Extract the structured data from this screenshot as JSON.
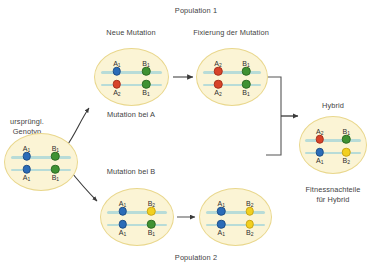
{
  "diagram": {
    "title_top": "Population 1",
    "title_bottom": "Population 2",
    "colors": {
      "cell_fill": "#fbf4d5",
      "cell_stroke": "#e9d78d",
      "chromosome": "#b8dcd8",
      "allele_A1": "#2b6cb8",
      "allele_A2": "#d8432a",
      "allele_B1": "#3f9233",
      "allele_B2": "#f2d020",
      "arrow": "#3a3a3a",
      "connector": "#555555"
    },
    "labels": {
      "original_genotype": "ursprüngl.\nGenotyp",
      "original_genotype_line1": "ursprüngl.",
      "original_genotype_line2": "Genotyp",
      "new_mutation": "Neue Mutation",
      "fixation": "Fixierung der Mutation",
      "mutation_at_a": "Mutation bei A",
      "mutation_at_b": "Mutation bei B",
      "hybrid": "Hybrid",
      "fitness_line1": "Fitnessnachteile",
      "fitness_line2": "für Hybrid"
    },
    "cells": [
      {
        "id": "original-genotype",
        "name": "cell-original-genotype",
        "top_chromosome": {
          "left": {
            "allele": "A1",
            "label": "A",
            "sub": "1",
            "color": "allele_A1"
          },
          "right": {
            "allele": "B1",
            "label": "B",
            "sub": "1",
            "color": "allele_B1"
          }
        },
        "bottom_chromosome": {
          "left": {
            "allele": "A1",
            "label": "A",
            "sub": "1",
            "color": "allele_A1"
          },
          "right": {
            "allele": "B1",
            "label": "B",
            "sub": "1",
            "color": "allele_B1"
          }
        }
      },
      {
        "id": "new-mutation",
        "name": "cell-new-mutation",
        "top_chromosome": {
          "left": {
            "allele": "A1",
            "label": "A",
            "sub": "1",
            "color": "allele_A1"
          },
          "right": {
            "allele": "B1",
            "label": "B",
            "sub": "1",
            "color": "allele_B1"
          }
        },
        "bottom_chromosome": {
          "left": {
            "allele": "A2",
            "label": "A",
            "sub": "2",
            "color": "allele_A2"
          },
          "right": {
            "allele": "B1",
            "label": "B",
            "sub": "1",
            "color": "allele_B1"
          }
        }
      },
      {
        "id": "fixation",
        "name": "cell-fixation",
        "top_chromosome": {
          "left": {
            "allele": "A2",
            "label": "A",
            "sub": "2",
            "color": "allele_A2"
          },
          "right": {
            "allele": "B1",
            "label": "B",
            "sub": "1",
            "color": "allele_B1"
          }
        },
        "bottom_chromosome": {
          "left": {
            "allele": "A2",
            "label": "A",
            "sub": "2",
            "color": "allele_A2"
          },
          "right": {
            "allele": "B1",
            "label": "B",
            "sub": "1",
            "color": "allele_B1"
          }
        }
      },
      {
        "id": "mutation-b",
        "name": "cell-mutation-b",
        "top_chromosome": {
          "left": {
            "allele": "A1",
            "label": "A",
            "sub": "1",
            "color": "allele_A1"
          },
          "right": {
            "allele": "B2",
            "label": "B",
            "sub": "2",
            "color": "allele_B2"
          }
        },
        "bottom_chromosome": {
          "left": {
            "allele": "A1",
            "label": "A",
            "sub": "1",
            "color": "allele_A1"
          },
          "right": {
            "allele": "B1",
            "label": "B",
            "sub": "1",
            "color": "allele_B1"
          }
        }
      },
      {
        "id": "fixation-b",
        "name": "cell-fixation-b",
        "top_chromosome": {
          "left": {
            "allele": "A1",
            "label": "A",
            "sub": "1",
            "color": "allele_A1"
          },
          "right": {
            "allele": "B2",
            "label": "B",
            "sub": "2",
            "color": "allele_B2"
          }
        },
        "bottom_chromosome": {
          "left": {
            "allele": "A1",
            "label": "A",
            "sub": "1",
            "color": "allele_A1"
          },
          "right": {
            "allele": "B2",
            "label": "B",
            "sub": "2",
            "color": "allele_B2"
          }
        }
      },
      {
        "id": "hybrid",
        "name": "cell-hybrid",
        "top_chromosome": {
          "left": {
            "allele": "A2",
            "label": "A",
            "sub": "2",
            "color": "allele_A2"
          },
          "right": {
            "allele": "B1",
            "label": "B",
            "sub": "1",
            "color": "allele_B1"
          }
        },
        "bottom_chromosome": {
          "left": {
            "allele": "A1",
            "label": "A",
            "sub": "1",
            "color": "allele_A1"
          },
          "right": {
            "allele": "B2",
            "label": "B",
            "sub": "2",
            "color": "allele_B2"
          }
        },
        "incompatibility_arrow": "A2 <-> B2"
      }
    ],
    "allele_text": {
      "A1": "A",
      "A1_sub": "1",
      "A2": "A",
      "A2_sub": "2",
      "B1": "B",
      "B1_sub": "1",
      "B2": "B",
      "B2_sub": "2"
    }
  }
}
